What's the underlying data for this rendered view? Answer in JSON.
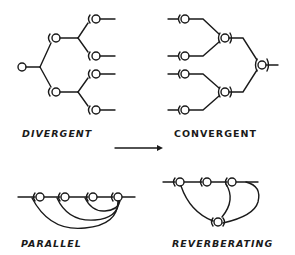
{
  "figure": {
    "ink_color": "#1a1a1a",
    "background_color": "#ffffff"
  },
  "panels": [
    {
      "id": "divergent",
      "label": "DIVERGENT",
      "neuron_count": 7
    },
    {
      "id": "convergent",
      "label": "CONVERGENT",
      "neuron_count": 7
    },
    {
      "id": "parallel",
      "label": "PARALLEL",
      "neuron_count": 4
    },
    {
      "id": "reverberating",
      "label": "REVERBERATING",
      "neuron_count": 4
    }
  ],
  "arrow": {
    "direction": "right"
  }
}
